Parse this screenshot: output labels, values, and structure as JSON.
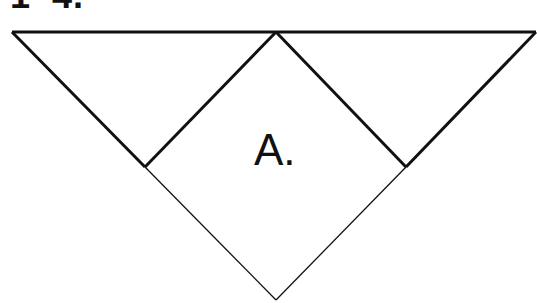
{
  "heading": "1–4.",
  "diagram": {
    "type": "quilt-block-triangle",
    "region_label": "A.",
    "stroke_color": "#111111",
    "vertices": {
      "top_left": [
        12,
        32
      ],
      "top_apex": [
        276,
        32
      ],
      "top_right": [
        536,
        32
      ],
      "left_mid": [
        145,
        167
      ],
      "right_mid": [
        406,
        167
      ],
      "bottom": [
        276,
        300
      ]
    }
  }
}
